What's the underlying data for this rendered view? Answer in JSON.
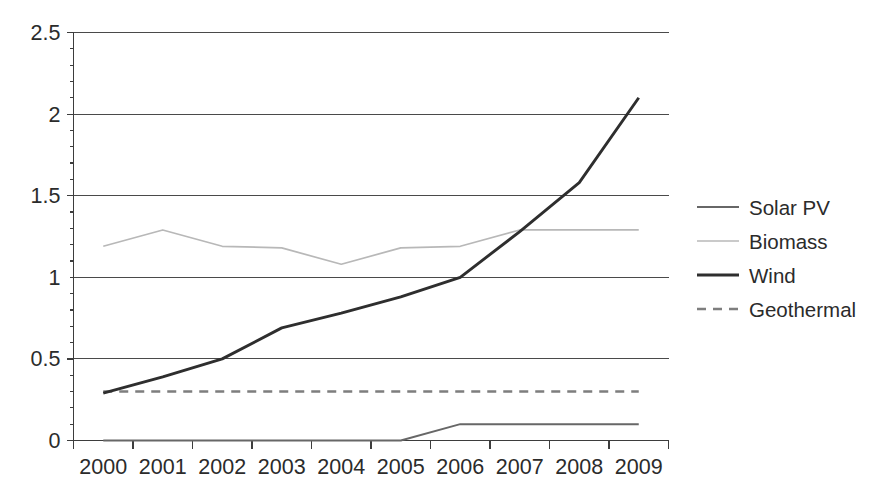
{
  "chart_data": {
    "type": "line",
    "title": "",
    "subtitle": "",
    "xlabel": "",
    "ylabel": "",
    "categories": [
      "2000",
      "2001",
      "2002",
      "2003",
      "2004",
      "2005",
      "2006",
      "2007",
      "2008",
      "2009"
    ],
    "x": [
      2000,
      2001,
      2002,
      2003,
      2004,
      2005,
      2006,
      2007,
      2008,
      2009
    ],
    "xlim": [
      2000,
      2009
    ],
    "ylim": [
      0,
      2.5
    ],
    "yticks": [
      0,
      0.5,
      1,
      1.5,
      2,
      2.5
    ],
    "ytick_labels": [
      "0",
      "0.5",
      "1",
      "1.5",
      "2",
      "2.5"
    ],
    "grid": "horizontal",
    "legend_position": "right",
    "series": [
      {
        "name": "Solar PV",
        "color": "#676767",
        "width": 1.9,
        "dash": "none",
        "values": [
          0,
          0,
          0,
          0,
          0,
          0,
          0.1,
          0.1,
          0.1,
          0.1
        ]
      },
      {
        "name": "Biomass",
        "color": "#b8b8b8",
        "width": 1.7,
        "dash": "none",
        "values": [
          1.19,
          1.29,
          1.19,
          1.18,
          1.08,
          1.18,
          1.19,
          1.29,
          1.29,
          1.29
        ]
      },
      {
        "name": "Wind",
        "color": "#2e2e2e",
        "width": 2.9,
        "dash": "none",
        "values": [
          0.29,
          0.39,
          0.5,
          0.69,
          0.78,
          0.88,
          1.0,
          1.28,
          1.58,
          2.1
        ]
      },
      {
        "name": "Geothermal",
        "color": "#7e7e7e",
        "width": 2.4,
        "dash": "9,7",
        "values": [
          0.3,
          0.3,
          0.3,
          0.3,
          0.3,
          0.3,
          0.3,
          0.3,
          0.3,
          0.3
        ]
      }
    ]
  },
  "legend": {
    "items": [
      {
        "label": "Solar PV"
      },
      {
        "label": "Biomass"
      },
      {
        "label": "Wind"
      },
      {
        "label": "Geothermal"
      }
    ]
  },
  "axes": {
    "y_tick_labels": [
      "2.5",
      "2",
      "1.5",
      "1",
      "0.5",
      "0"
    ],
    "x_tick_labels": [
      "2000",
      "2001",
      "2002",
      "2003",
      "2004",
      "2005",
      "2006",
      "2007",
      "2008",
      "2009"
    ]
  },
  "colors": {
    "background": "#ffffff",
    "grid": "#4a4a4a",
    "axis": "#3d3d3d",
    "text": "#2b2b2b",
    "solar_pv": "#676767",
    "biomass": "#b8b8b8",
    "wind": "#2e2e2e",
    "geothermal": "#7e7e7e"
  }
}
